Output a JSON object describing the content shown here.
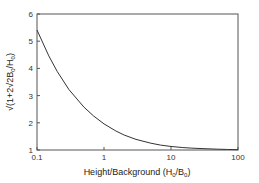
{
  "chart_data": {
    "type": "line",
    "title": "",
    "xlabel": "Height/Background (H0/B0)",
    "ylabel": "√(1+2√2B0/H0)",
    "xscale": "log",
    "xlim": [
      0.1,
      100
    ],
    "ylim": [
      1,
      6
    ],
    "xticks": [
      "0.1",
      "1",
      "10",
      "100"
    ],
    "yticks": [
      "1",
      "2",
      "3",
      "4",
      "5",
      "6"
    ],
    "grid": false,
    "legend": null,
    "series": [
      {
        "name": "sqrt(1+2*sqrt(2)*B0/H0)",
        "x": [
          0.1,
          0.15,
          0.2,
          0.3,
          0.5,
          0.7,
          1,
          1.5,
          2,
          3,
          5,
          7,
          10,
          15,
          20,
          30,
          50,
          70,
          100
        ],
        "values": [
          5.41,
          4.46,
          3.89,
          3.22,
          2.58,
          2.25,
          1.96,
          1.7,
          1.55,
          1.39,
          1.25,
          1.18,
          1.13,
          1.09,
          1.07,
          1.05,
          1.03,
          1.02,
          1.01
        ]
      }
    ],
    "colors": {
      "line": "#333333",
      "frame": "#555555"
    }
  },
  "axes": {
    "x_label_main": "Height/Background (H",
    "x_label_sub1": "0",
    "x_label_mid": "/B",
    "x_label_sub2": "0",
    "x_label_end": ")",
    "y_label_main": "√(1+2√2B",
    "y_label_sub1": "0",
    "y_label_mid": "/H",
    "y_label_sub2": "0",
    "y_label_end": ")"
  }
}
